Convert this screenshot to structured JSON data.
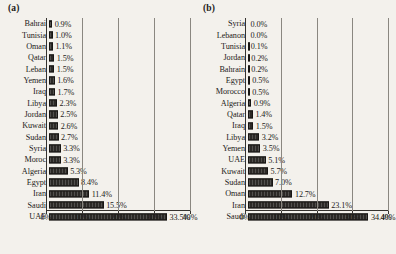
{
  "figure": {
    "panel_a_tag": "(a)",
    "panel_b_tag": "(b)"
  },
  "chart_data": [
    {
      "panel": "(a)",
      "type": "bar",
      "orientation": "horizontal",
      "title": "",
      "xlabel": "",
      "ylabel": "",
      "xlim": [
        0,
        40
      ],
      "xticks": [
        "0%",
        "10%",
        "20%",
        "30%",
        "40%"
      ],
      "xtick_values": [
        0,
        10,
        20,
        30,
        40
      ],
      "grid": true,
      "legend": "none",
      "categories": [
        "Bahrai",
        "Tunisia",
        "Oman",
        "Qatar",
        "Leban",
        "Yemen",
        "Iraq",
        "Libya",
        "Jordan",
        "Kuwait",
        "Sudan",
        "Syria",
        "Moroc",
        "Algeria",
        "Egypt",
        "Iran",
        "Saudi",
        "UAE"
      ],
      "values": [
        0.9,
        1.0,
        1.1,
        1.5,
        1.5,
        1.6,
        1.7,
        2.3,
        2.5,
        2.6,
        2.7,
        3.3,
        3.3,
        5.3,
        8.4,
        11.4,
        15.5,
        33.5
      ],
      "labels": [
        "0.9%",
        "1.0%",
        "1.1%",
        "1.5%",
        "1.5%",
        "1.6%",
        "1.7%",
        "2.3%",
        "2.5%",
        "2.6%",
        "2.7%",
        "3.3%",
        "3.3%",
        "5.3%",
        "8.4%",
        "11.4%",
        "15.5%",
        "33.5%"
      ]
    },
    {
      "panel": "(b)",
      "type": "bar",
      "orientation": "horizontal",
      "title": "",
      "xlabel": "",
      "ylabel": "",
      "xlim": [
        0,
        40
      ],
      "xticks": [
        "0%",
        "10%",
        "20%",
        "30%",
        "40%"
      ],
      "xtick_values": [
        0,
        10,
        20,
        30,
        40
      ],
      "grid": true,
      "legend": "none",
      "categories": [
        "Syria",
        "Lebanon",
        "Tunisia",
        "Jordan",
        "Bahrain",
        "Egypt",
        "Morocco",
        "Algeria",
        "Qatar",
        "Iraq",
        "Libya",
        "Yemen",
        "UAE",
        "Kuwait",
        "Sudan",
        "Oman",
        "Iran",
        "Saudi"
      ],
      "values": [
        0.0,
        0.0,
        0.1,
        0.2,
        0.2,
        0.5,
        0.5,
        0.9,
        1.4,
        1.5,
        3.2,
        3.5,
        5.1,
        5.7,
        7.0,
        12.7,
        23.1,
        34.4
      ],
      "labels": [
        "0.0%",
        "0.0%",
        "0.1%",
        "0.2%",
        "0.2%",
        "0.5%",
        "0.5%",
        "0.9%",
        "1.4%",
        "1.5%",
        "3.2%",
        "3.5%",
        "5.1%",
        "5.7%",
        "7.0%",
        "12.7%",
        "23.1%",
        "34.4%"
      ]
    }
  ],
  "style": {
    "bar_color": "#2b2926",
    "grid_color": "#8a8780",
    "axis_color": "#35322e",
    "background": "#f3f1ec"
  }
}
